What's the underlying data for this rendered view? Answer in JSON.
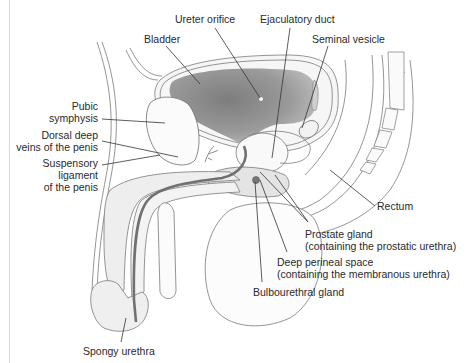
{
  "diagram": {
    "colors": {
      "background": "#ffffff",
      "outline": "#6a6a6a",
      "leader": "#333333",
      "bladder_fill": "#8c8c8c",
      "urethra": "#707070",
      "tissue_fill": "#ececec",
      "text": "#2a2a2a"
    },
    "labels": {
      "ureter_orifice": [
        "Ureter orifice"
      ],
      "ejaculatory_duct": [
        "Ejaculatory duct"
      ],
      "bladder": [
        "Bladder"
      ],
      "seminal_vesicle": [
        "Seminal vesicle"
      ],
      "pubic_symphysis": [
        "Pubic",
        "symphysis"
      ],
      "dorsal_deep_veins": [
        "Dorsal deep",
        "veins of the penis"
      ],
      "suspensory_ligament": [
        "Suspensory",
        "ligament",
        "of the penis"
      ],
      "rectum": [
        "Rectum"
      ],
      "prostate_gland": [
        "Prostate gland",
        "(containing the prostatic urethra)"
      ],
      "deep_perineal_space": [
        "Deep perineal space",
        "(containing the membranous urethra)"
      ],
      "bulbourethral_gland": [
        "Bulbourethral gland"
      ],
      "spongy_urethra": [
        "Spongy urethra"
      ]
    }
  }
}
